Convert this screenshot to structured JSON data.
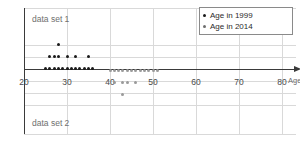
{
  "chart_data": {
    "type": "scatter",
    "title": "",
    "subtitle": "",
    "xlabel": "Age",
    "ylabel": "",
    "xlim": [
      20,
      80
    ],
    "xticks": [
      20,
      30,
      40,
      50,
      60,
      70,
      80
    ],
    "xtick_labels": [
      "20",
      "30",
      "40",
      "50",
      "60",
      "70",
      "80"
    ],
    "grid": true,
    "legend_position": "top-right",
    "annotations": [
      {
        "text": "data set 1",
        "x": 21.5,
        "row": 4
      },
      {
        "text": "data set 2",
        "row": -5,
        "x": 21.5
      }
    ],
    "series": [
      {
        "name": "Age in 1999",
        "color": "#1a1a1a",
        "direction": "up",
        "points": [
          {
            "x": 25,
            "stack": 1
          },
          {
            "x": 26,
            "stack": 1
          },
          {
            "x": 26,
            "stack": 2
          },
          {
            "x": 27,
            "stack": 1
          },
          {
            "x": 27,
            "stack": 2
          },
          {
            "x": 28,
            "stack": 1
          },
          {
            "x": 28,
            "stack": 2
          },
          {
            "x": 28,
            "stack": 3
          },
          {
            "x": 29,
            "stack": 1
          },
          {
            "x": 30,
            "stack": 1
          },
          {
            "x": 30,
            "stack": 2
          },
          {
            "x": 31,
            "stack": 1
          },
          {
            "x": 32,
            "stack": 1
          },
          {
            "x": 32,
            "stack": 2
          },
          {
            "x": 33,
            "stack": 1
          },
          {
            "x": 34,
            "stack": 1
          },
          {
            "x": 35,
            "stack": 1
          },
          {
            "x": 35,
            "stack": 2
          },
          {
            "x": 36,
            "stack": 1
          }
        ]
      },
      {
        "name": "Age in 2014",
        "color": "#9a9a9a",
        "direction": "down",
        "points": [
          {
            "x": 40,
            "stack": 1
          },
          {
            "x": 41,
            "stack": 1
          },
          {
            "x": 41,
            "stack": 2
          },
          {
            "x": 42,
            "stack": 1
          },
          {
            "x": 43,
            "stack": 1
          },
          {
            "x": 43,
            "stack": 2
          },
          {
            "x": 43,
            "stack": 3
          },
          {
            "x": 44,
            "stack": 1
          },
          {
            "x": 44,
            "stack": 2
          },
          {
            "x": 45,
            "stack": 1
          },
          {
            "x": 46,
            "stack": 1
          },
          {
            "x": 46,
            "stack": 2
          },
          {
            "x": 47,
            "stack": 1
          },
          {
            "x": 48,
            "stack": 1
          },
          {
            "x": 49,
            "stack": 1
          },
          {
            "x": 50,
            "stack": 1
          },
          {
            "x": 50,
            "stack": 2
          },
          {
            "x": 51,
            "stack": 1
          }
        ]
      }
    ]
  },
  "legend": {
    "entries": [
      {
        "label": "Age in 1999",
        "color": "#1a1a1a"
      },
      {
        "label": "Age in 2014",
        "color": "#6e6e6e"
      }
    ]
  },
  "labels": {
    "data_set_1": "data set 1",
    "data_set_2": "data set 2",
    "axis_title": "Age"
  }
}
